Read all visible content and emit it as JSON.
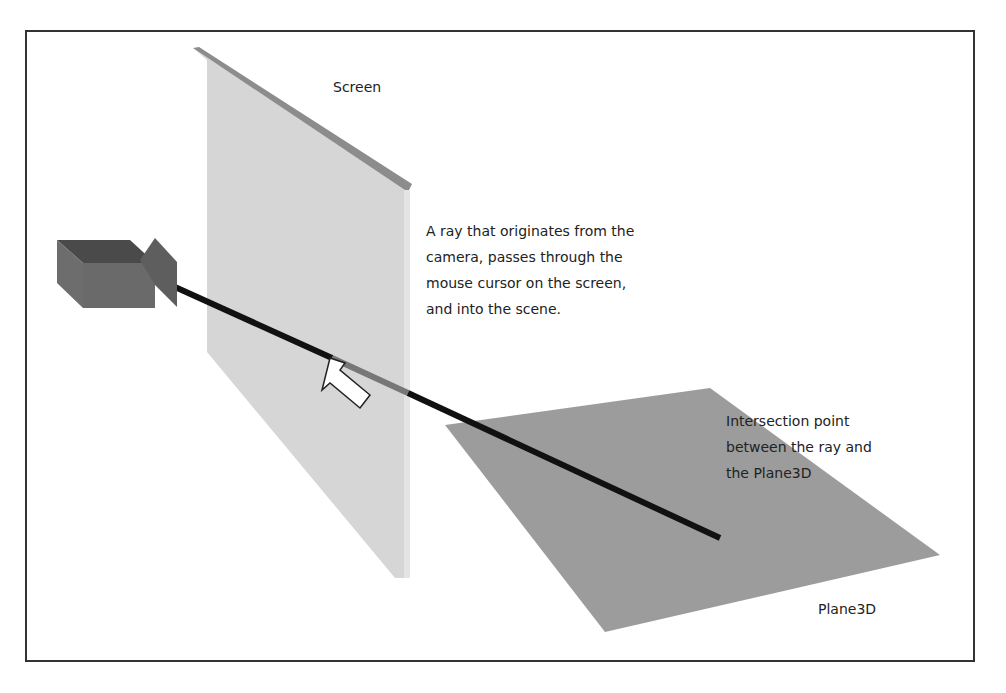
{
  "labels": {
    "screen": "Screen",
    "ray_description": [
      "A ray that originates from the",
      "camera, passes through the",
      "mouse cursor on the screen,",
      "and into the scene."
    ],
    "intersection": [
      "Intersection point",
      "between the ray and",
      "the Plane3D"
    ],
    "plane": "Plane3D"
  },
  "colors": {
    "screen_fill": "#d4d4d4",
    "screen_edge": "#8a8a8a",
    "plane_fill": "#9a9a9a",
    "camera_front": "#6a6a6a",
    "camera_top": "#505050",
    "ray": "#111111"
  }
}
